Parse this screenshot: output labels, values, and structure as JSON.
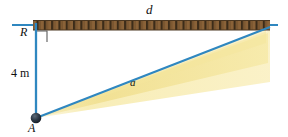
{
  "figure": {
    "type": "physics-geometry-diagram",
    "labels": {
      "span_label": "d",
      "slant_label": "a",
      "reference_label": "R",
      "point_label": "A",
      "height_label": "4 m"
    },
    "colors": {
      "line": "#2f87c0",
      "beam": "#f7e9a8",
      "beam_core": "#f2e08a",
      "surface": "#8a6238",
      "surface_dark": "#3a2a18",
      "point": "#1f2a36",
      "text": "#101010"
    },
    "geometry": {
      "point_a": [
        36,
        118
      ],
      "ceiling_y": 25,
      "ceiling_left_x": 33,
      "ceiling_right_x": 270,
      "baseline_left_x": 12,
      "baseline_right_x": 278,
      "surface_thickness": 9,
      "right_angle_size": 11
    }
  }
}
